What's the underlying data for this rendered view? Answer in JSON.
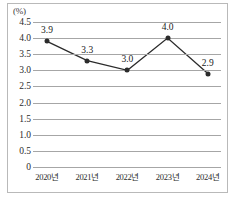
{
  "chart_data": {
    "type": "line",
    "title": "",
    "subtitle": "",
    "xlabel": "",
    "ylabel": "",
    "unit_label": "(%)",
    "categories": [
      "2020년",
      "2021년",
      "2022년",
      "2023년",
      "2024년"
    ],
    "values": [
      3.9,
      3.3,
      3.0,
      4.0,
      2.9
    ],
    "point_labels": [
      "3.9",
      "3.3",
      "3.0",
      "4.0",
      "2.9"
    ],
    "ylim": [
      0,
      4.5
    ],
    "ytick_values": [
      4.5,
      4.0,
      3.5,
      3.0,
      2.5,
      2.0,
      1.5,
      1.0,
      0.5,
      0
    ],
    "ytick_labels": [
      "4.5",
      "4.0",
      "3.5",
      "3.0",
      "2.5",
      "2.0",
      "1.5",
      "1.0",
      "0.5",
      "0"
    ],
    "grid": true,
    "legend": "none",
    "series_color": "#2b2b2b",
    "grid_color": "#a6a6a6",
    "frame_color": "#b9b9b9",
    "marker": "circle"
  }
}
